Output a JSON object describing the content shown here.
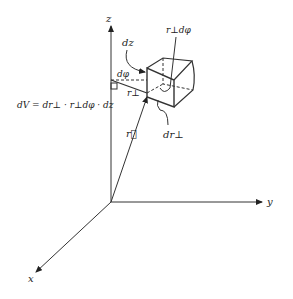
{
  "diagram": {
    "axes": {
      "z_label": "z",
      "y_label": "y",
      "x_label": "x"
    },
    "labels": {
      "dz": "dz",
      "r_perp_dphi": "r⊥dφ",
      "dphi": "dφ",
      "r_perp": "r⊥",
      "r_vec": "r⃗",
      "dr_perp": "dr⊥"
    },
    "formula": "dV = dr⊥ · r⊥dφ · dz"
  }
}
